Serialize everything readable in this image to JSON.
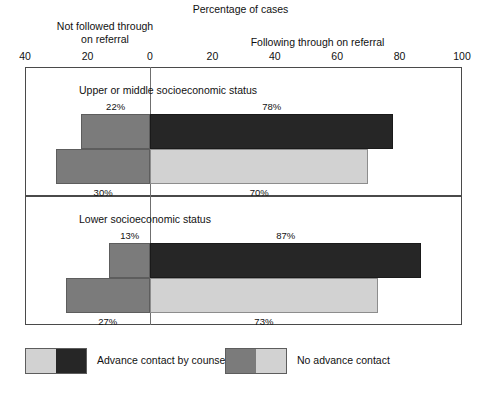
{
  "header": {
    "title": "Percentage of cases",
    "left_axis_label_line1": "Not followed through",
    "left_axis_label_line2": "on referral",
    "right_axis_label": "Following through on referral"
  },
  "axis": {
    "tick_labels": [
      "40",
      "20",
      "0",
      "20",
      "40",
      "60",
      "80",
      "100"
    ],
    "tick_values": [
      -40,
      -20,
      0,
      20,
      40,
      60,
      80,
      100
    ]
  },
  "panels": [
    {
      "caption": "Upper or middle socioeconomic status",
      "bars": [
        {
          "series": "Advance contact by counselor",
          "left_label": "22%",
          "right_label": "78%"
        },
        {
          "series": "No advance contact",
          "left_label": "30%",
          "right_label": "70%"
        }
      ]
    },
    {
      "caption": "Lower socioeconomic status",
      "bars": [
        {
          "series": "Advance contact by counselor",
          "left_label": "13%",
          "right_label": "87%"
        },
        {
          "series": "No advance contact",
          "left_label": "27%",
          "right_label": "73%"
        }
      ]
    }
  ],
  "legend": {
    "items": [
      {
        "label": "Advance contact by counselor"
      },
      {
        "label": "No advance contact"
      }
    ]
  },
  "colors": {
    "left_segment": "#7b7b7b",
    "right_segment_advance": "#262626",
    "right_segment_no_advance": "#d2d2d2",
    "frame": "#4a4a4a",
    "text": "#111111"
  },
  "chart_data": {
    "type": "bar",
    "title": "Percentage of cases",
    "xlabel": "Percentage of cases",
    "ylabel": "",
    "orientation": "horizontal",
    "layout": "diverging stacked bar, zero at center",
    "xlim": [
      -40,
      100
    ],
    "xticks": [
      -40,
      -20,
      0,
      20,
      40,
      60,
      80,
      100
    ],
    "xticklabels": [
      "40",
      "20",
      "0",
      "20",
      "40",
      "60",
      "80",
      "100"
    ],
    "grid": false,
    "legend_position": "bottom",
    "direction_labels": {
      "negative": "Not followed through on referral",
      "positive": "Following through on referral"
    },
    "groups": [
      "Upper or middle socioeconomic status",
      "Lower socioeconomic status"
    ],
    "series": [
      {
        "name": "Advance contact by counselor",
        "not_followed_through": [
          22,
          13
        ],
        "following_through": [
          78,
          87
        ]
      },
      {
        "name": "No advance contact",
        "not_followed_through": [
          30,
          27
        ],
        "following_through": [
          70,
          73
        ]
      }
    ],
    "data_labels": [
      {
        "group": "Upper or middle socioeconomic status",
        "series": "Advance contact by counselor",
        "left": "22%",
        "right": "78%"
      },
      {
        "group": "Upper or middle socioeconomic status",
        "series": "No advance contact",
        "left": "30%",
        "right": "70%"
      },
      {
        "group": "Lower socioeconomic status",
        "series": "Advance contact by counselor",
        "left": "13%",
        "right": "87%"
      },
      {
        "group": "Lower socioeconomic status",
        "series": "No advance contact",
        "left": "27%",
        "right": "73%"
      }
    ]
  }
}
